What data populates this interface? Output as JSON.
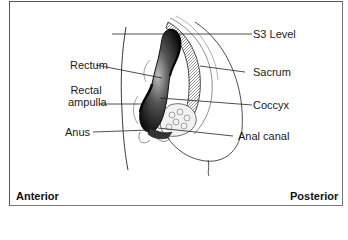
{
  "diagram": {
    "type": "anatomical-sagittal-section",
    "labels_left": [
      {
        "id": "rectum",
        "text": "Rectum"
      },
      {
        "id": "rectal-ampulla",
        "line1": "Rectal",
        "line2": "ampulla"
      },
      {
        "id": "anus",
        "text": "Anus"
      }
    ],
    "labels_right": [
      {
        "id": "s3-level",
        "text": "S3 Level"
      },
      {
        "id": "sacrum",
        "text": "Sacrum"
      },
      {
        "id": "coccyx",
        "text": "Coccyx"
      },
      {
        "id": "anal-canal",
        "text": "Anal canal"
      }
    ],
    "orientation": {
      "left": "Anterior",
      "right": "Posterior"
    },
    "colors": {
      "line": "#222222",
      "fill_dark": "#111111",
      "frame": "#555555",
      "background": "#ffffff"
    }
  }
}
